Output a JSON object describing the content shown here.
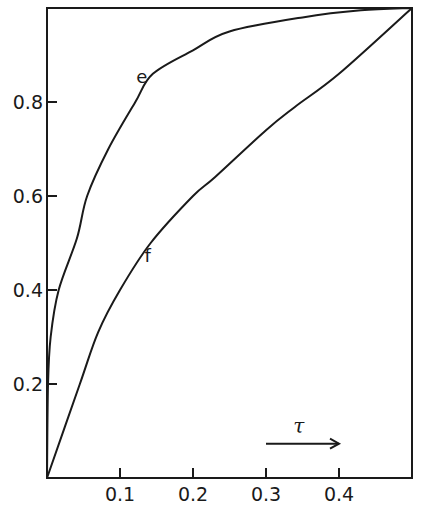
{
  "chart_data": {
    "type": "line",
    "title": "",
    "xlabel": "τ",
    "ylabel": "",
    "xlim": [
      0,
      0.5
    ],
    "ylim": [
      0,
      1.0
    ],
    "grid": false,
    "legend": "inline curve labels",
    "x_ticks": [
      "0.1",
      "0.2",
      "0.3",
      "0.4"
    ],
    "y_ticks": [
      "0.2",
      "0.4",
      "0.6",
      "0.8"
    ],
    "series": [
      {
        "name": "e",
        "x": [
          0,
          0.0014,
          0.005,
          0.016,
          0.041,
          0.055,
          0.084,
          0.121,
          0.145,
          0.2,
          0.25,
          0.35,
          0.43,
          0.5
        ],
        "y": [
          0,
          0.2,
          0.3,
          0.4,
          0.51,
          0.6,
          0.7,
          0.8,
          0.86,
          0.91,
          0.95,
          0.98,
          0.995,
          1.0
        ]
      },
      {
        "name": "f",
        "x": [
          0,
          0.045,
          0.07,
          0.1,
          0.142,
          0.2,
          0.23,
          0.3,
          0.34,
          0.4,
          0.5
        ],
        "y": [
          0,
          0.2,
          0.31,
          0.4,
          0.5,
          0.6,
          0.64,
          0.74,
          0.79,
          0.86,
          1.0
        ]
      }
    ],
    "annotations": [
      {
        "text": "e",
        "x": 0.13,
        "y": 0.84
      },
      {
        "text": "f",
        "x": 0.138,
        "y": 0.46
      },
      {
        "text": "τ",
        "x": 0.345,
        "y": 0.095,
        "arrow": {
          "from": 0.3,
          "to": 0.4,
          "y": 0.073
        }
      }
    ]
  }
}
